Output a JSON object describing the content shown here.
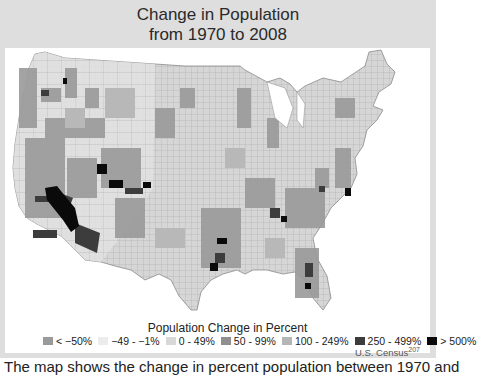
{
  "figure": {
    "title_line1": "Change in Population",
    "title_line2": "from 1970 to 2008",
    "legend_title": "Population Change in Percent",
    "legend": [
      {
        "label": "< −50%",
        "color": "#9a9a9a"
      },
      {
        "label": "−49 - −1%",
        "color": "#ececec"
      },
      {
        "label": "0 - 49%",
        "color": "#d8d8d8"
      },
      {
        "label": "50 - 99%",
        "color": "#8f8f8f"
      },
      {
        "label": "100 - 249%",
        "color": "#b5b5b5"
      },
      {
        "label": "250 - 499%",
        "color": "#3c3c3c"
      },
      {
        "label": "> 500%",
        "color": "#0a0a0a"
      }
    ],
    "credit": "U.S. Census",
    "credit_ref": "207",
    "caption_partial": "The map shows the change in percent population between 1970 and"
  },
  "colors": {
    "frame": "#dedede",
    "panel": "#ffffff",
    "land_base": "#d6d6d6",
    "county_border": "#9e9e9e"
  }
}
